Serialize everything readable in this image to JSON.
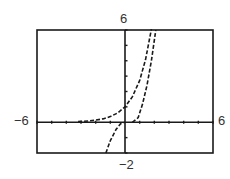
{
  "window": {
    "xmin_label": "−6",
    "xmax_label": "6",
    "ymin_label": "−2",
    "ymax_label": "6"
  },
  "chart_data": {
    "type": "line",
    "title": "",
    "xlabel": "",
    "ylabel": "",
    "xlim": [
      -6,
      6
    ],
    "ylim": [
      -2,
      6
    ],
    "xscale": 1,
    "yscale": 1,
    "grid": false,
    "legend": null,
    "series": [
      {
        "name": "curve-1",
        "style": "dashed",
        "points": [
          [
            -3.2,
            0.04
          ],
          [
            -2.5,
            0.08
          ],
          [
            -2,
            0.14
          ],
          [
            -1.5,
            0.22
          ],
          [
            -1,
            0.37
          ],
          [
            -0.5,
            0.61
          ],
          [
            0,
            1.0
          ],
          [
            0.5,
            1.65
          ],
          [
            1,
            2.72
          ],
          [
            1.4,
            4.06
          ],
          [
            1.8,
            6.05
          ]
        ]
      },
      {
        "name": "curve-2",
        "style": "dashed",
        "points": [
          [
            -1.3,
            -2.0
          ],
          [
            -1.0,
            -1.2
          ],
          [
            -0.6,
            -0.45
          ],
          [
            -0.3,
            -0.1
          ],
          [
            0.0,
            0.0
          ]
        ]
      },
      {
        "name": "curve-3",
        "style": "dashed",
        "points": [
          [
            0.5,
            0.0
          ],
          [
            0.9,
            0.3
          ],
          [
            1.2,
            1.2
          ],
          [
            1.5,
            2.4
          ],
          [
            1.8,
            4.0
          ],
          [
            2.1,
            6.0
          ]
        ]
      }
    ],
    "x_ticks": [
      -6,
      -5,
      -4,
      -3,
      -2,
      -1,
      0,
      1,
      2,
      3,
      4,
      5,
      6
    ],
    "y_ticks": [
      -2,
      -1,
      0,
      1,
      2,
      3,
      4,
      5,
      6
    ]
  },
  "colors": {
    "frame": "#1a1a1a",
    "axes": "#1a1a1a",
    "curve": "#1a1a1a"
  }
}
